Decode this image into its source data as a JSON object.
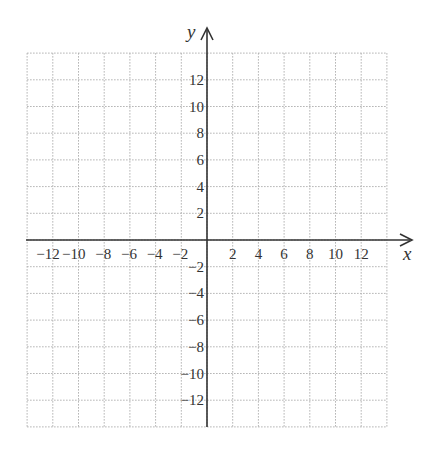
{
  "diagram": {
    "type": "coordinate-plane",
    "x_axis_label": "x",
    "y_axis_label": "y",
    "x_range": [
      -14,
      14
    ],
    "y_range": [
      -14,
      14
    ],
    "grid_step": 2,
    "grid_style": "dotted",
    "x_ticks": [
      "-12",
      "-10",
      "-8",
      "-6",
      "-4",
      "-2",
      "2",
      "4",
      "6",
      "8",
      "10",
      "12"
    ],
    "y_ticks": [
      "12",
      "10",
      "8",
      "6",
      "4",
      "2",
      "-2",
      "-4",
      "-6",
      "-8",
      "-10",
      "-12"
    ],
    "colors": {
      "axis": "#333333",
      "grid": "#b0b0b0",
      "text": "#333333"
    }
  }
}
